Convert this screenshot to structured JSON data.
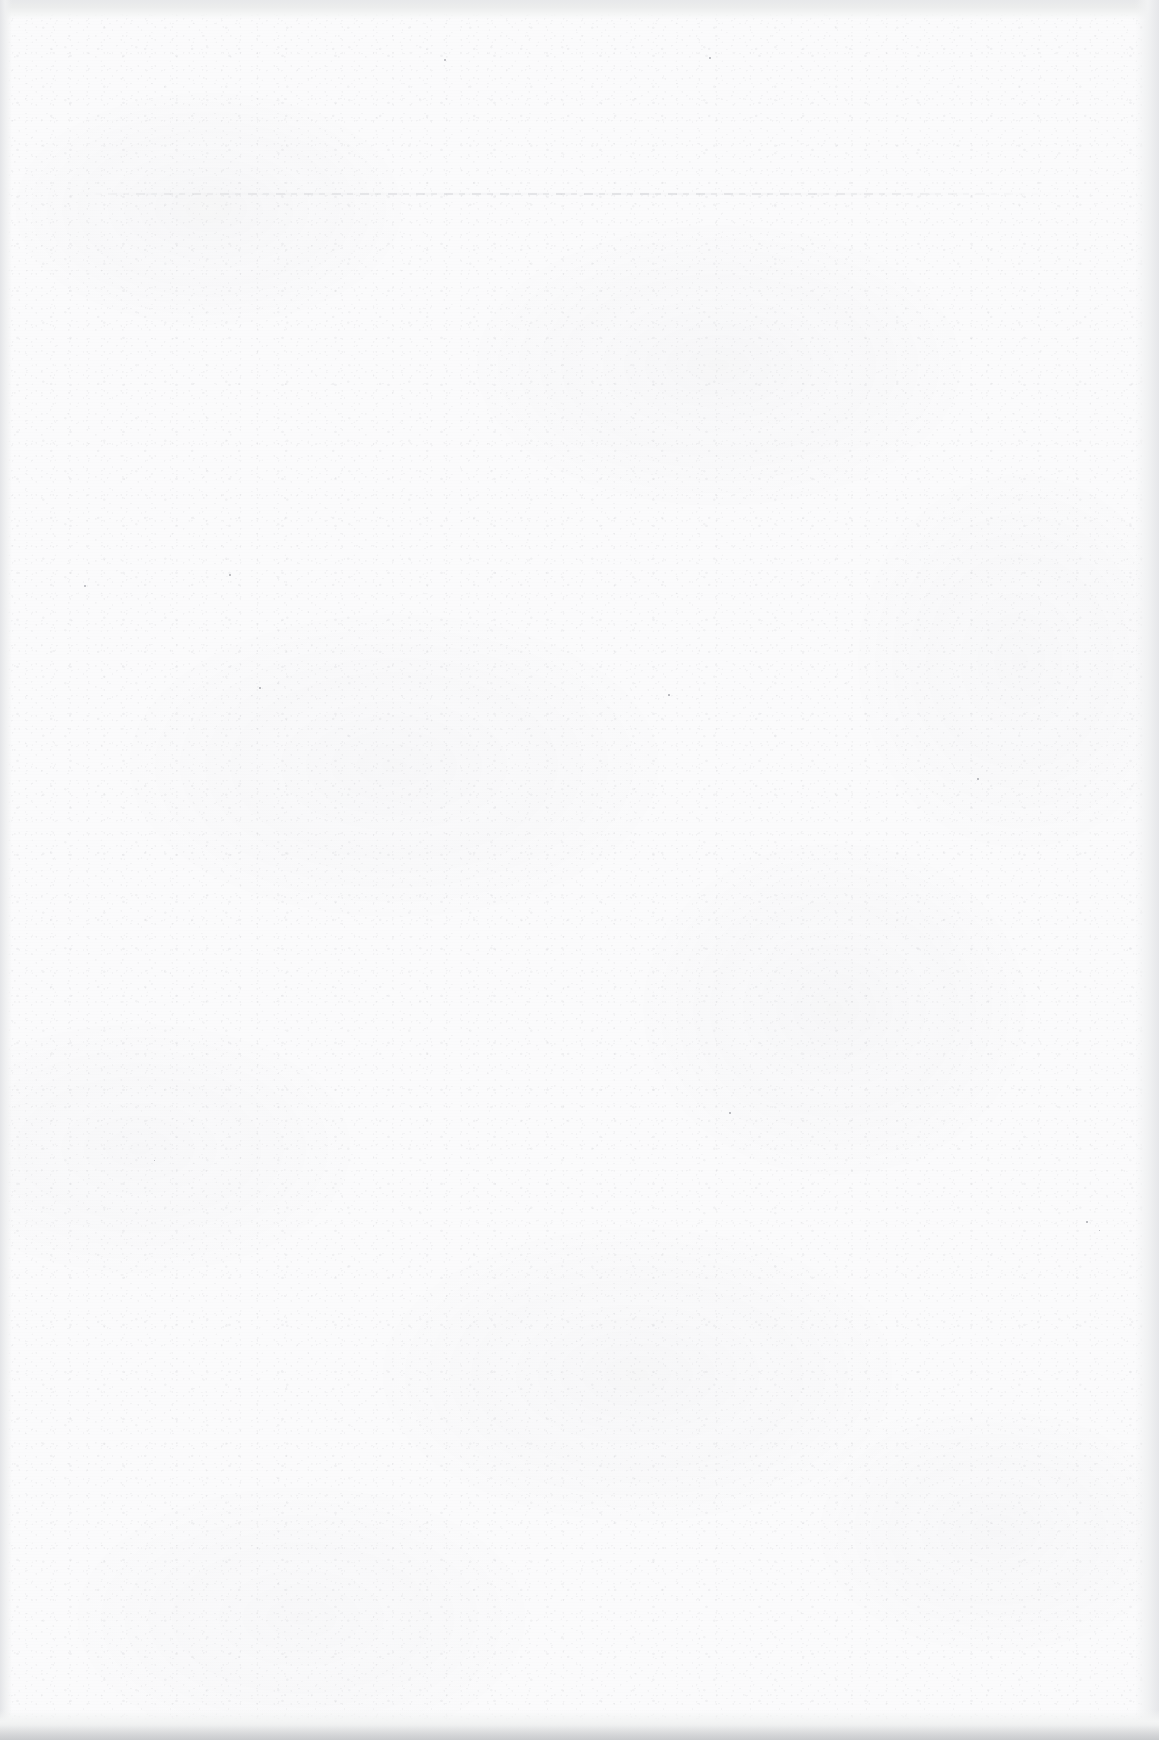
{
  "page": {
    "kind": "scanned-blank-page",
    "width": 1159,
    "height": 1740,
    "visible_text": "",
    "note": "This page is blank — no text, figures, captions, page numbers or headings are rendered anywhere in the scan."
  },
  "colors": {
    "paper": "#fbfbfc",
    "grain": "#96989e",
    "scanner_background": "#e7e8ea",
    "bottom_edge_shadow": "#dfe0e2",
    "bleed_rule": "#9295 9d"
  },
  "artifacts": {
    "bleed_rule": {
      "name": "faint-horizontal-rule",
      "description": "Extremely faint broken horizontal line, likely show-through of a header rule from the reverse side of the sheet",
      "x": 80,
      "y": 193,
      "width": 975,
      "thickness": 2
    },
    "edges": [
      {
        "name": "top-scanner-band",
        "position": "top",
        "thickness": 19
      },
      {
        "name": "bottom-scanner-band",
        "position": "bottom",
        "thickness": 30
      },
      {
        "name": "left-page-edge",
        "position": "left",
        "thickness": 12
      },
      {
        "name": "right-page-edge",
        "position": "right",
        "thickness": 24
      }
    ],
    "specks": [
      {
        "x": 444,
        "y": 59,
        "size": 2.0
      },
      {
        "x": 709,
        "y": 57,
        "size": 1.8
      },
      {
        "x": 84,
        "y": 585,
        "size": 1.9
      },
      {
        "x": 229,
        "y": 574,
        "size": 1.6
      },
      {
        "x": 668,
        "y": 694,
        "size": 1.7
      },
      {
        "x": 259,
        "y": 687,
        "size": 1.5
      },
      {
        "x": 977,
        "y": 778,
        "size": 1.6
      },
      {
        "x": 1086,
        "y": 1221,
        "size": 1.5
      },
      {
        "x": 1099,
        "y": 1230,
        "size": 1.4
      },
      {
        "x": 729,
        "y": 1112,
        "size": 1.5
      },
      {
        "x": 154,
        "y": 1160,
        "size": 1.4
      }
    ]
  }
}
